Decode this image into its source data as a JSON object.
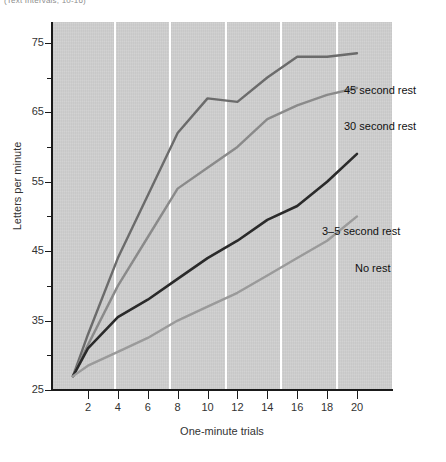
{
  "figure": {
    "top_caption": "(Text Intervals, 10-16)",
    "background_color": "#cfcfcf",
    "page_color": "#ffffff"
  },
  "chart_data": {
    "type": "line",
    "title": "",
    "xlabel": "One-minute trials",
    "ylabel": "Letters per minute",
    "xlim": [
      1,
      20
    ],
    "ylim": [
      25,
      78
    ],
    "xticks": [
      2,
      4,
      6,
      8,
      10,
      12,
      14,
      16,
      18,
      20
    ],
    "yticks": [
      25,
      35,
      45,
      55,
      65,
      75
    ],
    "yticks_minor": [
      30,
      40,
      50,
      60,
      70
    ],
    "grid": "vertical-only",
    "gridlines_x": [
      4,
      8,
      12,
      16,
      20
    ],
    "legend_position": "right-inline-labels",
    "x": [
      1,
      2,
      4,
      6,
      8,
      10,
      12,
      14,
      16,
      18,
      20
    ],
    "series": [
      {
        "name": "45 second rest",
        "label": "45 second rest",
        "color": "#6b6b6b",
        "values": [
          27,
          33,
          44,
          53,
          62,
          67,
          66.5,
          70,
          73,
          73,
          73.5
        ]
      },
      {
        "name": "30 second rest",
        "label": "30 second rest",
        "color": "#8a8a8a",
        "values": [
          27,
          31.5,
          40,
          47,
          54,
          57,
          60,
          64,
          66,
          67.5,
          68.5
        ]
      },
      {
        "name": "3–5 second rest",
        "label": "3–5 second rest",
        "color": "#2a2a2a",
        "values": [
          27,
          31,
          35.5,
          38,
          41,
          44,
          46.5,
          49.5,
          51.5,
          55,
          59
        ]
      },
      {
        "name": "No rest",
        "label": "No rest",
        "color": "#9a9a9a",
        "values": [
          27,
          28.5,
          30.5,
          32.5,
          35,
          37,
          39,
          41.5,
          44,
          46.5,
          50
        ]
      }
    ],
    "series_label_positions": [
      {
        "label": "45 second rest",
        "x": 344,
        "y": 84
      },
      {
        "label": "30 second rest",
        "x": 344,
        "y": 120
      },
      {
        "label": "3–5 second rest",
        "x": 322,
        "y": 225
      },
      {
        "label": "No rest",
        "x": 355,
        "y": 262
      }
    ]
  }
}
